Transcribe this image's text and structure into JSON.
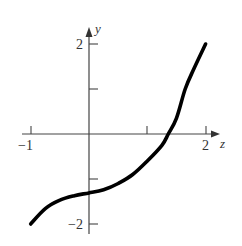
{
  "chart_data": {
    "type": "line",
    "title": "",
    "xlabel": "z",
    "ylabel": "y",
    "xlim": [
      -1,
      2
    ],
    "ylim": [
      -2,
      2
    ],
    "grid": false,
    "legend": null,
    "x_ticks": [
      -1,
      1,
      2
    ],
    "x_tick_labels": [
      "−1",
      "",
      "2"
    ],
    "y_ticks": [
      2,
      1,
      -1,
      -2
    ],
    "y_tick_labels": [
      "2",
      "",
      "",
      "−2"
    ],
    "series": [
      {
        "name": "curve",
        "color": "#000000",
        "x": [
          -1.0,
          -0.75,
          -0.5,
          -0.25,
          0.0,
          0.25,
          0.5,
          0.75,
          1.0,
          1.25,
          1.36,
          1.5,
          1.65,
          1.8,
          2.0
        ],
        "y": [
          -2.0,
          -1.66,
          -1.47,
          -1.37,
          -1.31,
          -1.24,
          -1.1,
          -0.9,
          -0.6,
          -0.25,
          0.0,
          0.35,
          1.0,
          1.45,
          2.0
        ]
      }
    ]
  },
  "labels": {
    "x_axis": "z",
    "y_axis": "y",
    "x_neg1": "−1",
    "x_2": "2",
    "y_2": "2",
    "y_neg2": "−2"
  }
}
